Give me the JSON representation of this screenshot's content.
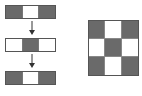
{
  "colors": {
    "dark": "#6a6a6a",
    "light": "#ffffff",
    "border": "#555555"
  },
  "left_sequence": {
    "strips": [
      {
        "cells": [
          "dark",
          "light",
          "dark"
        ]
      },
      {
        "cells": [
          "light",
          "dark",
          "light"
        ]
      },
      {
        "cells": [
          "dark",
          "light",
          "dark"
        ]
      }
    ],
    "arrows": [
      "down-arrow-icon",
      "down-arrow-icon"
    ]
  },
  "right_grid": {
    "rows": 3,
    "cols": 3,
    "cells": [
      [
        "dark",
        "light",
        "dark"
      ],
      [
        "light",
        "dark",
        "light"
      ],
      [
        "dark",
        "light",
        "dark"
      ]
    ]
  }
}
